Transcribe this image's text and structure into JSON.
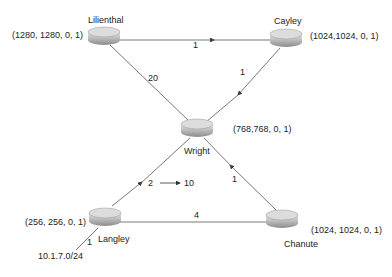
{
  "routers": [
    {
      "name": "Lilienthal",
      "coords": "(1280, 1280, 0, 1)"
    },
    {
      "name": "Cayley",
      "coords": "(1024,1024, 0, 1)"
    },
    {
      "name": "Wright",
      "coords": "(768,768, 0, 1)"
    },
    {
      "name": "Langley",
      "coords": "(256, 256, 0, 1)"
    },
    {
      "name": "Chanute",
      "coords": "(1024, 1024, 0, 1)"
    }
  ],
  "links": {
    "lilienthal_cayley": "1",
    "lilienthal_wright": "20",
    "cayley_wright": "1",
    "langley_wright": "2",
    "langley_wright_result": "10",
    "chanute_wright": "1",
    "langley_chanute": "4",
    "langley_stub": "1"
  },
  "network": "10.1.7.0/24",
  "colors": {
    "line": "#555555",
    "router_top": "#d8d8d8",
    "router_side": "#9a9a9a"
  }
}
